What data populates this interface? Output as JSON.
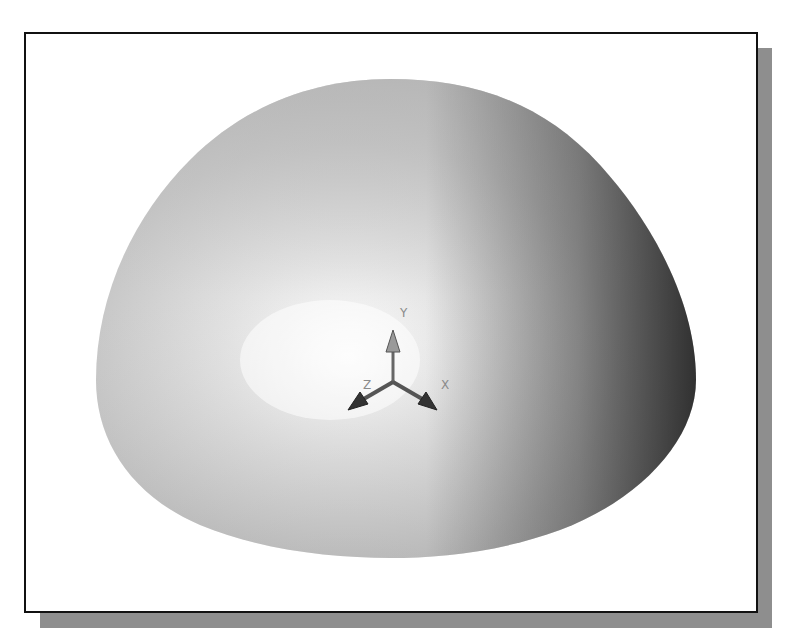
{
  "figure": {
    "colors": {
      "frame_border": "#111111",
      "shadow": "#8e8e8e",
      "surface_light": "#f4f4f4",
      "surface_mid": "#c6c6c6",
      "surface_dark": "#3a3a3a",
      "triad": "#555555"
    }
  },
  "triad": {
    "x_label": "X",
    "y_label": "Y",
    "z_label": "Z"
  }
}
